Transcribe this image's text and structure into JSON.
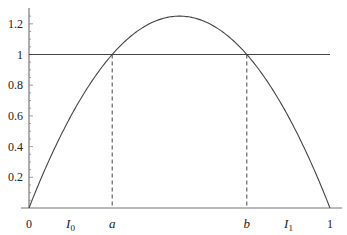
{
  "chart_data": {
    "type": "line",
    "title": "",
    "xlabel": "",
    "ylabel": "",
    "xlim": [
      0,
      1
    ],
    "ylim": [
      0,
      1.25
    ],
    "grid": false,
    "series": [
      {
        "name": "f(x) = 5x(1-x)",
        "function": "5*x*(1-x)",
        "x_range": [
          0,
          1
        ],
        "style": "solid"
      },
      {
        "name": "y = 1",
        "function": "1",
        "x_range": [
          0,
          1
        ],
        "style": "solid"
      }
    ],
    "annotations": [
      {
        "label": "a",
        "x": 0.2764,
        "style": "dashed-vertical"
      },
      {
        "label": "b",
        "x": 0.7236,
        "style": "dashed-vertical"
      }
    ],
    "x_ticks": [
      {
        "label": "0",
        "x": 0
      },
      {
        "label": "I0",
        "sub": "0",
        "base": "I",
        "x": 0.138
      },
      {
        "label": "a",
        "x": 0.2764
      },
      {
        "label": "b",
        "x": 0.7236
      },
      {
        "label": "I1",
        "sub": "1",
        "base": "I",
        "x": 0.862
      },
      {
        "label": "1",
        "x": 1
      }
    ],
    "y_ticks": [
      {
        "label": "0.2",
        "y": 0.2
      },
      {
        "label": "0.4",
        "y": 0.4
      },
      {
        "label": "0.6",
        "y": 0.6
      },
      {
        "label": "0.8",
        "y": 0.8
      },
      {
        "label": "1",
        "y": 1.0
      },
      {
        "label": "1.2",
        "y": 1.2
      }
    ]
  }
}
